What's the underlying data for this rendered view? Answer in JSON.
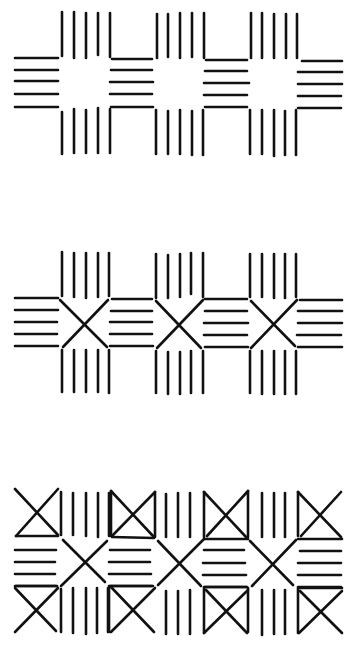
{
  "figure": {
    "ink_color": "#111111",
    "background": "#ffffff",
    "patterns": [
      {
        "name": "blocks-pattern",
        "units": 3,
        "y": 0
      },
      {
        "name": "cross-pattern",
        "units": 3,
        "y": 230
      },
      {
        "name": "diamond-cross-pattern",
        "units": 3,
        "y": 470
      }
    ]
  }
}
